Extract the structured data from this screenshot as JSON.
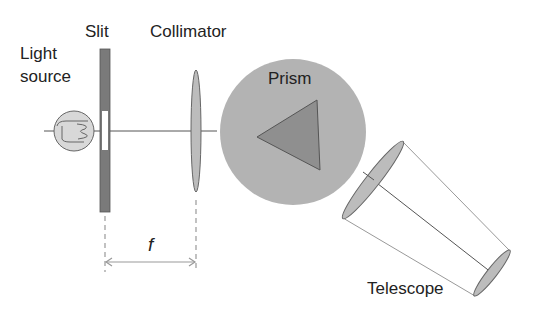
{
  "diagram": {
    "labels": {
      "light_source_line1": "Light",
      "light_source_line2": "source",
      "slit": "Slit",
      "collimator": "Collimator",
      "prism": "Prism",
      "telescope": "Telescope",
      "focal_length": "f"
    },
    "components": [
      {
        "name": "light-source",
        "shape": "circle with filament"
      },
      {
        "name": "slit",
        "shape": "vertical bar with opening"
      },
      {
        "name": "collimator",
        "shape": "lens"
      },
      {
        "name": "prism",
        "shape": "triangle on circular table"
      },
      {
        "name": "telescope",
        "shape": "two lenses in cone"
      }
    ],
    "colors": {
      "slit_bar": "#7a7a7a",
      "lens_fill": "#bcbcbc",
      "prism_table": "#b3b3b3",
      "prism": "#8f8f8f",
      "line": "#555555",
      "light_line": "#9a9a9a"
    },
    "dimension": {
      "from": "slit",
      "to": "collimator",
      "label": "f"
    }
  }
}
